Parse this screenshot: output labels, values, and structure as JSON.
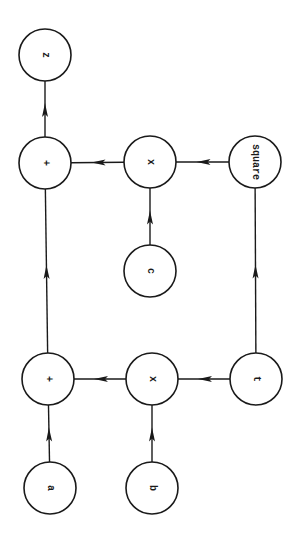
{
  "diagram": {
    "type": "computation-graph",
    "orientation": "rotated-90-ccw",
    "stroke_color": "#1a1a1a",
    "background": "#ffffff",
    "nodes": [
      {
        "id": "z",
        "label": "z",
        "cx": 45,
        "cy": 55,
        "r": 26
      },
      {
        "id": "plus1",
        "label": "+",
        "cx": 45,
        "cy": 163,
        "r": 26
      },
      {
        "id": "mul1",
        "label": "x",
        "cx": 150,
        "cy": 162,
        "r": 26
      },
      {
        "id": "square",
        "label": "square",
        "cx": 255,
        "cy": 162,
        "r": 26
      },
      {
        "id": "c",
        "label": "c",
        "cx": 150,
        "cy": 271,
        "r": 26
      },
      {
        "id": "plus2",
        "label": "+",
        "cx": 48,
        "cy": 379,
        "r": 26
      },
      {
        "id": "mul2",
        "label": "x",
        "cx": 152,
        "cy": 379,
        "r": 26
      },
      {
        "id": "t",
        "label": "t",
        "cx": 256,
        "cy": 379,
        "r": 26
      },
      {
        "id": "a",
        "label": "a",
        "cx": 50,
        "cy": 488,
        "r": 26
      },
      {
        "id": "b",
        "label": "b",
        "cx": 152,
        "cy": 488,
        "r": 26
      }
    ],
    "edges": [
      {
        "from": "plus1",
        "to": "z"
      },
      {
        "from": "mul1",
        "to": "plus1"
      },
      {
        "from": "square",
        "to": "mul1"
      },
      {
        "from": "c",
        "to": "mul1"
      },
      {
        "from": "t",
        "to": "square"
      },
      {
        "from": "plus2",
        "to": "plus1"
      },
      {
        "from": "mul2",
        "to": "plus2"
      },
      {
        "from": "t",
        "to": "mul2"
      },
      {
        "from": "a",
        "to": "plus2"
      },
      {
        "from": "b",
        "to": "mul2"
      }
    ]
  }
}
